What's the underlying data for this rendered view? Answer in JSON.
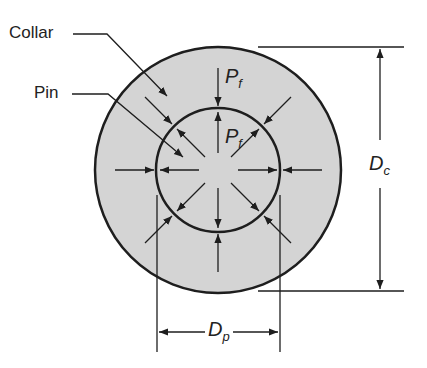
{
  "diagram": {
    "labels": {
      "collar": "Collar",
      "pin": "Pin",
      "pressure_outer": {
        "main": "P",
        "sub": "f"
      },
      "pressure_inner": {
        "main": "P",
        "sub": "f"
      },
      "collar_diameter": {
        "main": "D",
        "sub": "c"
      },
      "pin_diameter": {
        "main": "D",
        "sub": "p"
      }
    },
    "colors": {
      "collar_fill": "#d4d4d4",
      "stroke": "#1e1e1e",
      "background": "#ffffff"
    },
    "geometry": {
      "center": [
        218,
        170
      ],
      "outer_radius": 123,
      "inner_radius": 62
    }
  }
}
